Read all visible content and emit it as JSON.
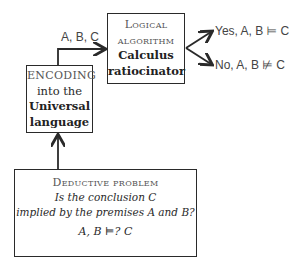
{
  "diagram": {
    "encoding_box": {
      "line1": "ENCODING",
      "line2": "into the",
      "line3": "Universal",
      "line4": "language"
    },
    "logic_box": {
      "line1": "Logical",
      "line2": "algorithm",
      "line3": "Calculus",
      "line4": "ratiocinator"
    },
    "problem_box": {
      "title": "Deductive problem",
      "line1": "Is the conclusion C",
      "line2": "implied by the premises A and B?",
      "formula": "A, B ⊨? C"
    },
    "edge_label_input": "A, B, C",
    "outputs": {
      "yes": "Yes, A, B ⊨ C",
      "no": "No, A, B ⊭ C"
    },
    "colors": {
      "stroke": "#2a2a2a",
      "text": "#2a2a2a",
      "muted_text": "#555555",
      "background": "#ffffff"
    }
  }
}
